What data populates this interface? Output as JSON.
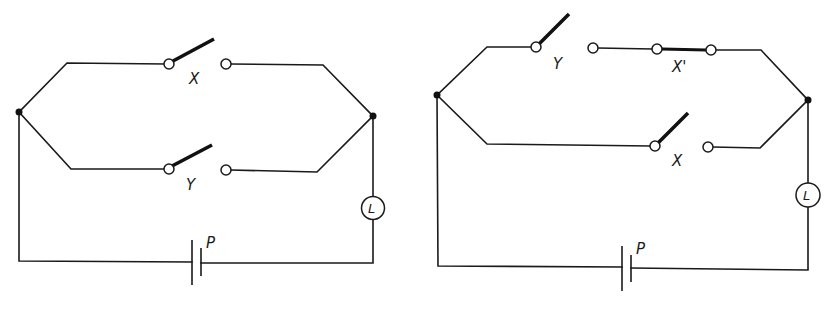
{
  "figure": {
    "type": "circuit-diagram",
    "background": "#ffffff",
    "ink_color": "#1a1a1a"
  },
  "circuit_left": {
    "switch_top": {
      "label": "X",
      "state": "open"
    },
    "switch_bottom": {
      "label": "Y",
      "state": "open"
    },
    "lamp": {
      "label": "L"
    },
    "battery": {
      "label": "P"
    }
  },
  "circuit_right": {
    "switch_top": {
      "label": "Y",
      "state": "open"
    },
    "switch_top_series": {
      "label": "X'",
      "state": "closed"
    },
    "switch_bottom": {
      "label": "X",
      "state": "open"
    },
    "lamp": {
      "label": "L"
    },
    "battery": {
      "label": "P"
    }
  }
}
